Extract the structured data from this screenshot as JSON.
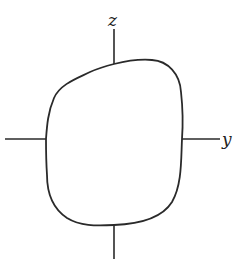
{
  "diagram": {
    "axes": {
      "vertical_label": "z",
      "horizontal_label": "y"
    },
    "colors": {
      "stroke": "#2a2a2a",
      "background": "#ffffff"
    }
  }
}
